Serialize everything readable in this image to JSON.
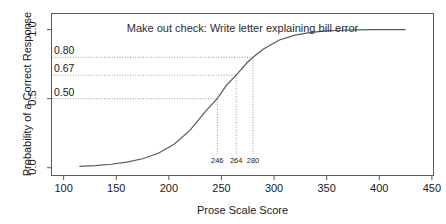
{
  "chart_data": {
    "type": "line",
    "title": "Make out check: Write letter explaining bill error",
    "xlabel": "Prose Scale Score",
    "ylabel": "Probability of a Correct Response",
    "xlim": [
      88,
      452
    ],
    "ylim": [
      -0.06,
      1.12
    ],
    "grid": false,
    "legend": "none",
    "xticks": [
      100,
      150,
      200,
      250,
      300,
      350,
      400,
      450
    ],
    "xtick_labels": [
      "100",
      "150",
      "200",
      "250",
      "300",
      "350",
      "400",
      "450"
    ],
    "yticks": [
      0.0,
      0.5,
      1.0
    ],
    "ytick_labels": [
      "0.0",
      "0.5",
      "1.0"
    ],
    "series": [
      {
        "name": "Item response curve",
        "model": "logistic",
        "x_start": 115,
        "x_end": 425,
        "x": [
          115,
          130,
          145,
          160,
          175,
          190,
          205,
          220,
          235,
          246,
          255,
          264,
          275,
          280,
          290,
          305,
          320,
          335,
          350,
          365,
          380,
          395,
          410,
          425
        ],
        "y": [
          0.01,
          0.015,
          0.025,
          0.04,
          0.065,
          0.105,
          0.17,
          0.27,
          0.41,
          0.5,
          0.6,
          0.67,
          0.765,
          0.8,
          0.86,
          0.925,
          0.96,
          0.98,
          0.99,
          0.995,
          0.998,
          0.999,
          1.0,
          1.0
        ]
      }
    ],
    "annotations": [
      {
        "probability": 0.8,
        "prob_label": "0.80",
        "score": 280,
        "score_label": "280"
      },
      {
        "probability": 0.67,
        "prob_label": "0.67",
        "score": 264,
        "score_label": "264"
      },
      {
        "probability": 0.5,
        "prob_label": "0.50",
        "score": 246,
        "score_label": "246"
      }
    ],
    "colors": {
      "curve": "#5a5a5a",
      "frame": "#5a5a5a",
      "guide": "#9a9a9a",
      "text": "#1a1a1a",
      "background": "#ffffff"
    }
  }
}
